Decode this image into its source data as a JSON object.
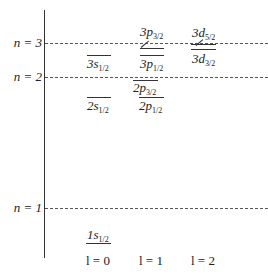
{
  "diagram": {
    "type": "energy-level-diagram",
    "shell_lines": [
      {
        "n_label": "n = 3",
        "y": 43
      },
      {
        "n_label": "n = 2",
        "y": 77
      },
      {
        "n_label": "n = 1",
        "y": 208
      }
    ],
    "levels": [
      {
        "id": "1s1/2",
        "main": "1s",
        "sub": "1/2",
        "column": 0,
        "label_pos": "above"
      },
      {
        "id": "2s1/2",
        "main": "2s",
        "sub": "1/2",
        "column": 0,
        "label_pos": "below"
      },
      {
        "id": "3s1/2",
        "main": "3s",
        "sub": "1/2",
        "column": 0,
        "label_pos": "below"
      },
      {
        "id": "2p1/2",
        "main": "2p",
        "sub": "1/2",
        "column": 1,
        "label_pos": "below"
      },
      {
        "id": "2p3/2",
        "main": "2p",
        "sub": "3/2",
        "column": 1,
        "label_pos": "below"
      },
      {
        "id": "3p1/2",
        "main": "3p",
        "sub": "1/2",
        "column": 1,
        "label_pos": "below"
      },
      {
        "id": "3p3/2",
        "main": "3p",
        "sub": "3/2",
        "column": 1,
        "label_pos": "above"
      },
      {
        "id": "3d3/2",
        "main": "3d",
        "sub": "3/2",
        "column": 2,
        "label_pos": "below"
      },
      {
        "id": "3d5/2",
        "main": "3d",
        "sub": "5/2",
        "column": 2,
        "label_pos": "above"
      }
    ],
    "l_labels": [
      "l = 0",
      "l = 1",
      "l = 2"
    ],
    "colors": {
      "line": "#333333",
      "dash": "#555555",
      "background": "#ffffff"
    }
  }
}
